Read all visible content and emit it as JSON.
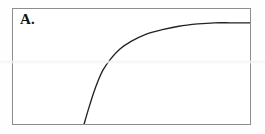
{
  "panel": {
    "label": "A.",
    "frame_color": "#8d8d8d",
    "background_color": "#ffffff",
    "page_background_color": "#fefefe"
  },
  "chart_data": {
    "type": "line",
    "title": "A.",
    "subtitle": "",
    "xlabel": "",
    "ylabel": "",
    "xlim": [
      0,
      100
    ],
    "ylim": [
      0,
      100
    ],
    "grid": false,
    "legend": false,
    "legend_position": "none",
    "axis_ticks": false,
    "tick_labels": [],
    "annotations": [],
    "series": [
      {
        "name": "saturating-curve",
        "color": "#232323",
        "line_width": 1.35,
        "description": "Concave-down saturating curve: rises steeply from the bottom axis, bends sharply at a knee, then flattens toward an asymptote at the upper right.",
        "x": [
          30,
          32,
          34,
          36,
          38,
          41,
          45,
          50,
          56,
          63,
          70,
          78,
          85,
          92,
          100
        ],
        "y": [
          0,
          14,
          27,
          38,
          47,
          56,
          65,
          72,
          78,
          82,
          85,
          87,
          88,
          88,
          88
        ]
      }
    ]
  }
}
